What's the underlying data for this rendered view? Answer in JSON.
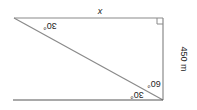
{
  "diagram": {
    "orientation": "rotated 180 degrees",
    "colors": {
      "line": "#8a8a8a",
      "bottom_line": "#555555",
      "text": "#222222",
      "background": "#ffffff"
    },
    "labels": {
      "top_side": "x",
      "right_side": "450 m",
      "angle_top_left": "30°",
      "angle_bottom_right_upper": "60°",
      "angle_bottom_right_lower": "30°"
    },
    "right_angle_marker": "top-right corner"
  }
}
